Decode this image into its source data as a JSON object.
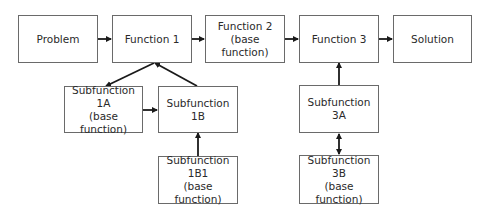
{
  "diagram": {
    "nodes": {
      "problem": {
        "lines": [
          "Problem"
        ]
      },
      "function1": {
        "lines": [
          "Function 1"
        ]
      },
      "function2": {
        "lines": [
          "Function 2",
          "(base function)"
        ]
      },
      "function3": {
        "lines": [
          "Function 3"
        ]
      },
      "solution": {
        "lines": [
          "Solution"
        ]
      },
      "sub1a": {
        "lines": [
          "Subfunction",
          "1A",
          "(base function)"
        ]
      },
      "sub1b": {
        "lines": [
          "Subfunction",
          "1B"
        ]
      },
      "sub1b1": {
        "lines": [
          "Subfunction",
          "1B1",
          "(base function)"
        ]
      },
      "sub3a": {
        "lines": [
          "Subfunction",
          "3A"
        ]
      },
      "sub3b": {
        "lines": [
          "Subfunction",
          "3B",
          "(base function)"
        ]
      }
    },
    "edges": [
      {
        "from": "Problem",
        "to": "Function 1"
      },
      {
        "from": "Function 1",
        "to": "Function 2"
      },
      {
        "from": "Function 2",
        "to": "Function 3"
      },
      {
        "from": "Function 3",
        "to": "Solution"
      },
      {
        "from": "Function 1",
        "to": "Subfunction 1A"
      },
      {
        "from": "Subfunction 1B",
        "to": "Function 1"
      },
      {
        "from": "Subfunction 1A",
        "to": "Subfunction 1B"
      },
      {
        "from": "Subfunction 1B1",
        "to": "Subfunction 1B"
      },
      {
        "from": "Subfunction 3A",
        "to": "Function 3"
      },
      {
        "from": "Subfunction 3A",
        "to": "Subfunction 3B",
        "bidirectional": true
      }
    ],
    "colors": {
      "stroke": "#6a6a6a",
      "arrow": "#1a1a1a",
      "text": "#2a2a2a"
    }
  }
}
